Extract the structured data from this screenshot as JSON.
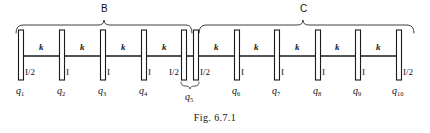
{
  "figure": {
    "caption": "Fig. 6.7.1",
    "groups": [
      {
        "id": "B",
        "label": "B",
        "x_start": 16,
        "x_end": 192,
        "label_x": 104
      },
      {
        "id": "C",
        "label": "C",
        "x_start": 199,
        "x_end": 414,
        "label_x": 303
      }
    ],
    "spring_label": "k",
    "springs": [
      {
        "label": "k",
        "x": 41
      },
      {
        "label": "k",
        "x": 82
      },
      {
        "label": "k",
        "x": 123
      },
      {
        "label": "k",
        "x": 164
      },
      {
        "label": "k",
        "x": 216
      },
      {
        "label": "k",
        "x": 257
      },
      {
        "label": "k",
        "x": 297
      },
      {
        "label": "k",
        "x": 338
      },
      {
        "label": "k",
        "x": 378
      }
    ],
    "bars": [
      {
        "x": 21,
        "inertia": "I/2",
        "inertia_x": 27,
        "coordinate": "q",
        "subscript": "1",
        "q_x": 21
      },
      {
        "x": 62,
        "inertia": "I",
        "inertia_x": 68,
        "coordinate": "q",
        "subscript": "2",
        "q_x": 62
      },
      {
        "x": 103,
        "inertia": "I",
        "inertia_x": 109,
        "coordinate": "q",
        "subscript": "3",
        "q_x": 103
      },
      {
        "x": 144,
        "inertia": "I",
        "inertia_x": 150,
        "coordinate": "q",
        "subscript": "4",
        "q_x": 144
      },
      {
        "x": 184,
        "inertia": "I/2",
        "inertia_x": 172,
        "coordinate": null,
        "subscript": null,
        "q_x": null
      },
      {
        "x": 196,
        "inertia": "I/2",
        "inertia_x": 202,
        "coordinate": "q",
        "subscript": "5",
        "q_x": 190
      },
      {
        "x": 237,
        "inertia": "I",
        "inertia_x": 243,
        "coordinate": "q",
        "subscript": "6",
        "q_x": 237
      },
      {
        "x": 277,
        "inertia": "I",
        "inertia_x": 283,
        "coordinate": "q",
        "subscript": "7",
        "q_x": 277
      },
      {
        "x": 318,
        "inertia": "I",
        "inertia_x": 324,
        "coordinate": "q",
        "subscript": "8",
        "q_x": 318
      },
      {
        "x": 358,
        "inertia": "I",
        "inertia_x": 364,
        "coordinate": "q",
        "subscript": "9",
        "q_x": 358
      },
      {
        "x": 399,
        "inertia": "I/2",
        "inertia_x": 405,
        "coordinate": "q",
        "subscript": "10",
        "q_x": 399
      }
    ],
    "q5_brace": {
      "x_start": 181,
      "x_end": 199,
      "label": "q",
      "subscript": "5"
    },
    "colors": {
      "ink": "#1a1a1a",
      "background": "#ffffff"
    }
  }
}
